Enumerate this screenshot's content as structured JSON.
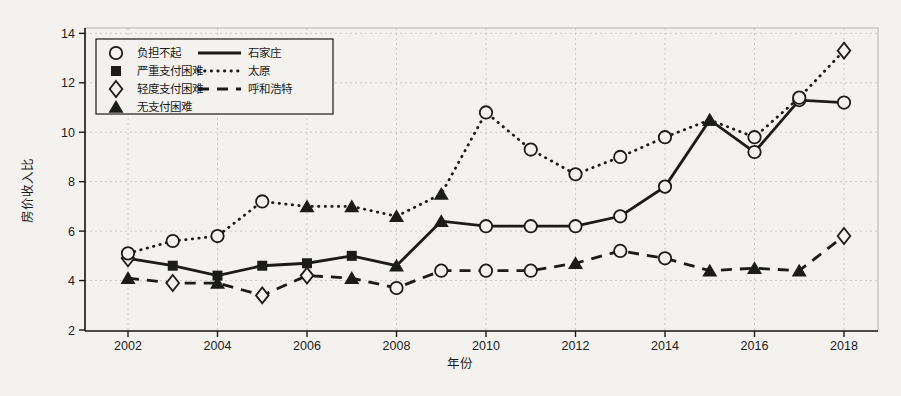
{
  "figure_type": "scanned line chart",
  "chart_data": {
    "type": "line",
    "title": "",
    "xlabel": "年份",
    "ylabel": "房价收入比",
    "xlim": [
      2001,
      2018.8
    ],
    "ylim": [
      2,
      14.2
    ],
    "x_ticks": [
      2002,
      2004,
      2006,
      2008,
      2010,
      2012,
      2014,
      2016,
      2018
    ],
    "y_ticks": [
      2,
      4,
      6,
      8,
      10,
      12,
      14
    ],
    "grid": true,
    "x": [
      2002,
      2003,
      2004,
      2005,
      2006,
      2007,
      2008,
      2009,
      2010,
      2011,
      2012,
      2013,
      2014,
      2015,
      2016,
      2017,
      2018
    ],
    "series": [
      {
        "name": "石家庄",
        "line_style": "solid",
        "values": [
          4.9,
          4.6,
          4.2,
          4.6,
          4.7,
          5.0,
          4.6,
          6.4,
          6.2,
          6.2,
          6.2,
          6.6,
          7.8,
          10.5,
          9.2,
          11.3,
          11.2
        ],
        "markers": [
          "diamond-open",
          "square-filled",
          "square-filled",
          "square-filled",
          "square-filled",
          "square-filled",
          "triangle-filled",
          "triangle-filled",
          "circle-open",
          "circle-open",
          "circle-open",
          "circle-open",
          "circle-open",
          "triangle-filled",
          "circle-open",
          "circle-open",
          "circle-open"
        ]
      },
      {
        "name": "太原",
        "line_style": "dotted",
        "values": [
          5.1,
          5.6,
          5.8,
          7.2,
          7.0,
          7.0,
          6.6,
          7.5,
          10.8,
          9.3,
          8.3,
          9.0,
          9.8,
          10.5,
          9.8,
          11.4,
          13.3
        ],
        "markers": [
          "circle-open",
          "circle-open",
          "circle-open",
          "circle-open",
          "triangle-filled",
          "triangle-filled",
          "triangle-filled",
          "triangle-filled",
          "circle-open",
          "circle-open",
          "circle-open",
          "circle-open",
          "circle-open",
          "triangle-filled",
          "circle-open",
          "circle-open",
          "diamond-open"
        ]
      },
      {
        "name": "呼和浩特",
        "line_style": "dashed",
        "values": [
          4.1,
          3.9,
          3.9,
          3.4,
          4.2,
          4.1,
          3.7,
          4.4,
          4.4,
          4.4,
          4.7,
          5.2,
          4.9,
          4.4,
          4.5,
          4.4,
          5.8
        ],
        "markers": [
          "triangle-filled",
          "diamond-open",
          "triangle-filled",
          "diamond-open",
          "diamond-open",
          "triangle-filled",
          "circle-open",
          "circle-open",
          "circle-open",
          "circle-open",
          "triangle-filled",
          "circle-open",
          "circle-open",
          "triangle-filled",
          "triangle-filled",
          "triangle-filled",
          "diamond-open"
        ]
      }
    ],
    "marker_legend": [
      {
        "symbol": "circle-open",
        "label": "负担不起"
      },
      {
        "symbol": "square-filled",
        "label": "严重支付困难"
      },
      {
        "symbol": "diamond-open",
        "label": "轻度支付困难"
      },
      {
        "symbol": "triangle-filled",
        "label": "无支付困难"
      }
    ],
    "line_legend": [
      {
        "line_style": "solid",
        "label": "石家庄"
      },
      {
        "line_style": "dotted",
        "label": "太原"
      },
      {
        "line_style": "dashed",
        "label": "呼和浩特"
      }
    ],
    "colors": {
      "ink": "#1b1b1b",
      "paper": "#f3f2ee",
      "grid": "#cccac2",
      "frame": "#b5b3ab"
    }
  }
}
